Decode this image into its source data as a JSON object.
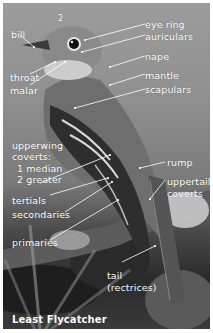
{
  "figure": {
    "subject": "Least Flycatcher",
    "caption": "Least Flycatcher",
    "colors": {
      "label": "#ffffff",
      "border": "#ffffff"
    },
    "labels": {
      "bill": "bill",
      "eye_ring": "eye ring",
      "auriculars": "auriculars",
      "nape": "nape",
      "throat": "throat",
      "malar": "malar",
      "mantle": "mantle",
      "scapulars": "scapulars",
      "wing_marker_2": "2",
      "upperwing_coverts_line1": "upperwing",
      "upperwing_coverts_line2": "coverts:",
      "upperwing_coverts_median": "1 median",
      "upperwing_coverts_greater": "2 greater",
      "rump": "rump",
      "tertials": "tertials",
      "uppertail_coverts_line1": "uppertail",
      "uppertail_coverts_line2": "coverts",
      "secondaries": "secondaries",
      "primaries": "primaries",
      "tail_line1": "tail",
      "tail_line2": "(rectrices)"
    }
  }
}
